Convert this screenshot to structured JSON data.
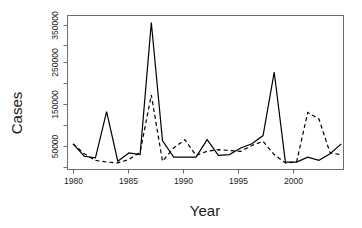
{
  "chart_data": {
    "type": "line",
    "title": "",
    "xlabel": "Year",
    "ylabel": "Cases",
    "xlim": [
      1979.5,
      2004.2
    ],
    "ylim": [
      0,
      372000
    ],
    "grid": false,
    "legend": "none",
    "x_ticks": [
      1980,
      1985,
      1990,
      1995,
      2000
    ],
    "x_tick_labels": [
      "1980",
      "1985",
      "1990",
      "1995",
      "2000"
    ],
    "y_ticks": [
      50000,
      150000,
      250000,
      350000
    ],
    "y_tick_labels": [
      "50000",
      "150000",
      "250000",
      "350000"
    ],
    "y_minor_ticks": [
      100000,
      200000,
      300000
    ],
    "x": [
      1980,
      1981,
      1982,
      1983,
      1984,
      1985,
      1986,
      1987,
      1988,
      1989,
      1990,
      1991,
      1992,
      1993,
      1994,
      1995,
      1996,
      1997,
      1998,
      1999,
      2000,
      2001,
      2002,
      2003,
      2004
    ],
    "series": [
      {
        "name": "solid-series",
        "style": "solid",
        "color": "#000000",
        "values": [
          62000,
          32000,
          28000,
          140000,
          20000,
          40000,
          36000,
          355000,
          70000,
          30000,
          30000,
          30000,
          72000,
          34000,
          36000,
          52000,
          62000,
          82000,
          235000,
          18000,
          18000,
          30000,
          22000,
          38000,
          62000
        ]
      },
      {
        "name": "dashed-series",
        "style": "dashed",
        "color": "#000000",
        "values": [
          62000,
          38000,
          22000,
          18000,
          16000,
          24000,
          42000,
          180000,
          20000,
          52000,
          72000,
          34000,
          44000,
          48000,
          46000,
          44000,
          58000,
          68000,
          36000,
          16000,
          18000,
          138000,
          122000,
          40000,
          36000
        ]
      }
    ]
  },
  "axis": {
    "y_label": "Cases",
    "x_label": "Year"
  },
  "y_tick_labels": [
    "350000",
    "250000",
    "150000",
    "50000"
  ],
  "x_tick_labels": [
    "1980",
    "1985",
    "1990",
    "1995",
    "2000"
  ]
}
